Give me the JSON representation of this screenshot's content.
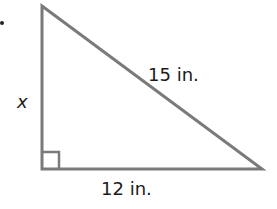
{
  "diagram": {
    "type": "right-triangle",
    "vertices": {
      "top": [
        42,
        6
      ],
      "right_angle": [
        42,
        169
      ],
      "right": [
        262,
        169
      ]
    },
    "stroke_color": "#7a7a7a",
    "labels": {
      "vertical_leg": "x",
      "hypotenuse": "15 in.",
      "horizontal_leg": "12 in."
    },
    "right_angle_marker": true,
    "bullet": "•"
  }
}
